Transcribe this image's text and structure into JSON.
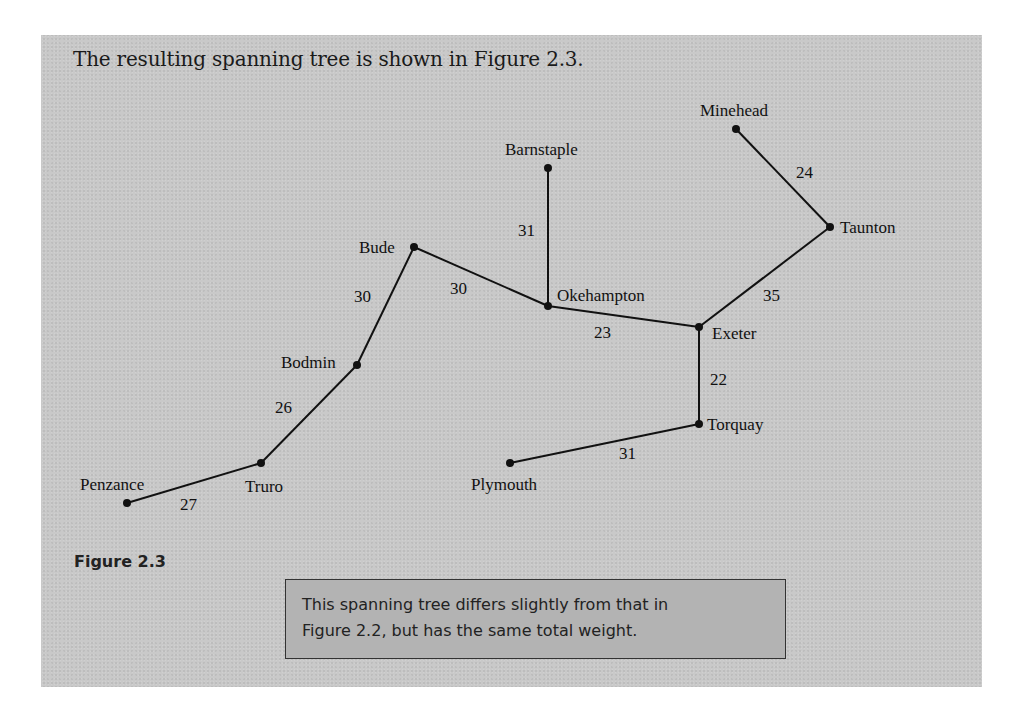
{
  "intro_text": "The resulting spanning tree is shown in Figure 2.3.",
  "figure_label": "Figure 2.3",
  "note": {
    "line1": "This spanning tree differs slightly from that in",
    "line2": "Figure 2.2, but has the same total weight."
  },
  "colors": {
    "panel_bg": "#c9c9c9",
    "note_bg": "#b3b3b3",
    "edge": "#111111"
  },
  "graph": {
    "nodes": [
      {
        "id": "minehead",
        "label": "Minehead",
        "x": 736,
        "y": 129
      },
      {
        "id": "taunton",
        "label": "Taunton",
        "x": 830,
        "y": 227
      },
      {
        "id": "barnstaple",
        "label": "Barnstaple",
        "x": 548,
        "y": 168
      },
      {
        "id": "bude",
        "label": "Bude",
        "x": 414,
        "y": 247
      },
      {
        "id": "okehampton",
        "label": "Okehampton",
        "x": 548,
        "y": 306
      },
      {
        "id": "exeter",
        "label": "Exeter",
        "x": 699,
        "y": 327
      },
      {
        "id": "bodmin",
        "label": "Bodmin",
        "x": 357,
        "y": 365
      },
      {
        "id": "torquay",
        "label": "Torquay",
        "x": 699,
        "y": 424
      },
      {
        "id": "truro",
        "label": "Truro",
        "x": 261,
        "y": 463
      },
      {
        "id": "plymouth",
        "label": "Plymouth",
        "x": 510,
        "y": 463
      },
      {
        "id": "penzance",
        "label": "Penzance",
        "x": 127,
        "y": 503
      }
    ],
    "edges": [
      {
        "from": "minehead",
        "to": "taunton",
        "weight": "24"
      },
      {
        "from": "taunton",
        "to": "exeter",
        "weight": "35"
      },
      {
        "from": "barnstaple",
        "to": "okehampton",
        "weight": "31"
      },
      {
        "from": "bude",
        "to": "okehampton",
        "weight": "30"
      },
      {
        "from": "okehampton",
        "to": "exeter",
        "weight": "23"
      },
      {
        "from": "bude",
        "to": "bodmin",
        "weight": "30"
      },
      {
        "from": "exeter",
        "to": "torquay",
        "weight": "22"
      },
      {
        "from": "bodmin",
        "to": "truro",
        "weight": "26"
      },
      {
        "from": "torquay",
        "to": "plymouth",
        "weight": "31"
      },
      {
        "from": "truro",
        "to": "penzance",
        "weight": "27"
      }
    ]
  }
}
